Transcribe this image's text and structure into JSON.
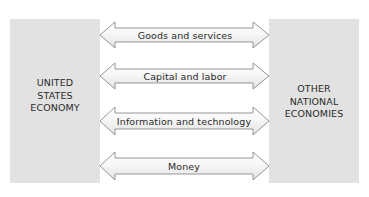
{
  "diagram": {
    "type": "flow-diagram",
    "left_box": {
      "lines": [
        "UNITED",
        "STATES",
        "ECONOMY"
      ]
    },
    "right_box": {
      "lines": [
        "OTHER",
        "NATIONAL",
        "ECONOMIES"
      ]
    },
    "flows": [
      {
        "label": "Goods and services",
        "direction": "bidirectional"
      },
      {
        "label": "Capital and labor",
        "direction": "bidirectional"
      },
      {
        "label": "Information and technology",
        "direction": "bidirectional"
      },
      {
        "label": "Money",
        "direction": "bidirectional"
      }
    ],
    "colors": {
      "box_fill": "#e2e2e2",
      "arrow_fill_top": "#ffffff",
      "arrow_fill_bottom": "#e6e6e6",
      "arrow_stroke": "#8a8a8a",
      "text": "#2a2a2a"
    }
  }
}
